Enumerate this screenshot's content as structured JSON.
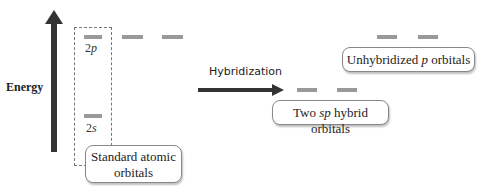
{
  "axis": {
    "label": "Energy"
  },
  "standard": {
    "orbital_2p": {
      "label_num": "2",
      "label_letter": "p"
    },
    "orbital_2s": {
      "label_num": "2",
      "label_letter": "s"
    },
    "caption_line1": "Standard atomic",
    "caption_line2": "orbitals"
  },
  "process": {
    "label": "Hybridization"
  },
  "hybrid": {
    "caption_pre": "Two ",
    "caption_em": "sp",
    "caption_post": " hybrid orbitals"
  },
  "unhybridized": {
    "caption_pre": "Unhybridized ",
    "caption_em": "p",
    "caption_post": " orbitals"
  },
  "colors": {
    "arrow": "#333333",
    "orbital_line": "#999999",
    "box_border": "#888888"
  }
}
